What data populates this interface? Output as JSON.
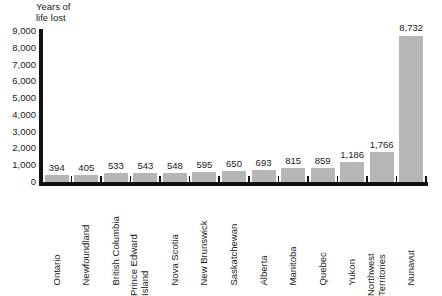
{
  "chart_data": {
    "type": "bar",
    "title": "",
    "ylabel": "Years of\nlife lost",
    "xlabel": "",
    "ylim": [
      0,
      9000
    ],
    "grid": false,
    "legend": "none",
    "bar_color": "#b6b6b6",
    "axis_color": "#111111",
    "yticks": [
      "9,000",
      "8,000",
      "7,000",
      "6,000",
      "5,000",
      "4,000",
      "3,000",
      "2,000",
      "1,000",
      "0"
    ],
    "ytick_values": [
      9000,
      8000,
      7000,
      6000,
      5000,
      4000,
      3000,
      2000,
      1000,
      0
    ],
    "categories": [
      "Ontario",
      "Newfoundland",
      "British Columbia",
      "Prince Edward\nIsland",
      "Nova Scotia",
      "New Brunswick",
      "Saskatchewan",
      "Alberta",
      "Manitoba",
      "Quebec",
      "Yukon",
      "Northwest\nTerritories",
      "Nunavut"
    ],
    "values": [
      394,
      405,
      533,
      543,
      548,
      595,
      650,
      693,
      815,
      859,
      1186,
      1766,
      8732
    ],
    "value_labels": [
      "394",
      "405",
      "533",
      "543",
      "548",
      "595",
      "650",
      "693",
      "815",
      "859",
      "1,186",
      "1,766",
      "8,732"
    ]
  }
}
